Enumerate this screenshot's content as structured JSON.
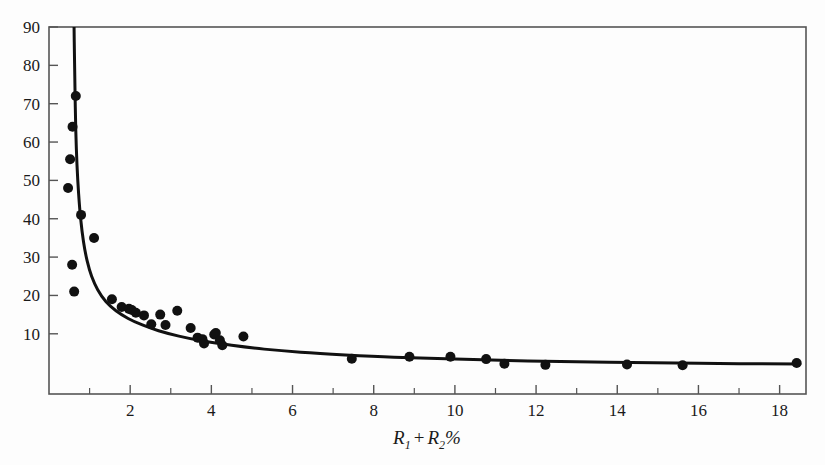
{
  "chart_data": {
    "type": "scatter",
    "title": "",
    "subtitle": "",
    "xlabel": "R_1 + R_2 %",
    "xlabel_parts": {
      "r1_base": "R",
      "r1_sub": "1",
      "operator": "+",
      "r2_base": "R",
      "r2_sub": "2",
      "unit": "%"
    },
    "ylabel": "",
    "xlim": [
      0,
      18.65
    ],
    "ylim": [
      -5.7,
      90
    ],
    "grid": false,
    "legend": null,
    "xticks_major": [
      2,
      4,
      6,
      8,
      10,
      12,
      14,
      16,
      18
    ],
    "xticks_major_labels": [
      "2",
      "4",
      "6",
      "8",
      "10",
      "12",
      "14",
      "16",
      "18"
    ],
    "xticks_minor": [
      1,
      3,
      5,
      7,
      9,
      11,
      13,
      15,
      17
    ],
    "yticks_major": [
      10,
      20,
      30,
      40,
      50,
      60,
      70,
      80,
      90
    ],
    "yticks_major_labels": [
      "10",
      "20",
      "30",
      "40",
      "50",
      "60",
      "70",
      "80",
      "90"
    ],
    "marker": "filled-circle",
    "marker_color": "#111111",
    "marker_size_px": 5,
    "line_color": "#111111",
    "line_width_px": 3,
    "axis_color": "#555555",
    "series": [
      {
        "name": "observations",
        "type": "scatter",
        "x": [
          0.66,
          0.58,
          0.52,
          0.47,
          0.79,
          1.11,
          0.57,
          0.62,
          1.55,
          1.79,
          1.97,
          2.04,
          2.14,
          2.34,
          2.74,
          2.52,
          2.87,
          3.16,
          3.49,
          3.66,
          3.78,
          3.82,
          4.07,
          4.11,
          4.21,
          4.27,
          4.79,
          7.46,
          8.88,
          9.89,
          10.77,
          11.22,
          12.23,
          14.24,
          15.61,
          18.42
        ],
        "y": [
          72.0,
          64.0,
          55.5,
          48.0,
          41.0,
          35.0,
          28.0,
          21.0,
          19.0,
          17.0,
          16.5,
          16.2,
          15.5,
          14.8,
          15.0,
          12.5,
          12.3,
          16.0,
          11.5,
          9.0,
          8.6,
          7.5,
          9.8,
          10.2,
          8.3,
          7.0,
          9.3,
          3.5,
          4.0,
          4.0,
          3.4,
          2.2,
          1.9,
          2.0,
          1.8,
          2.4
        ]
      },
      {
        "name": "fitted-curve",
        "type": "line",
        "note": "hyperbolic fit y = a/(x - b) style decay through the point cloud",
        "x": [
          0.615,
          0.625,
          0.64,
          0.66,
          0.69,
          0.73,
          0.78,
          0.85,
          0.94,
          1.05,
          1.2,
          1.4,
          1.65,
          1.95,
          2.3,
          2.7,
          3.2,
          3.8,
          4.5,
          5.3,
          6.2,
          7.3,
          8.5,
          10.0,
          11.8,
          13.8,
          16.0,
          18.5
        ],
        "y": [
          92.0,
          84.0,
          74.0,
          63.0,
          54.0,
          46.5,
          40.0,
          34.0,
          29.0,
          25.0,
          21.5,
          18.4,
          16.0,
          14.0,
          12.3,
          10.8,
          9.4,
          8.1,
          7.0,
          6.0,
          5.2,
          4.5,
          3.9,
          3.4,
          2.9,
          2.6,
          2.3,
          2.1
        ]
      }
    ]
  },
  "figure": {
    "background_color": "#fdfdfd",
    "frame_color": "#555555"
  }
}
